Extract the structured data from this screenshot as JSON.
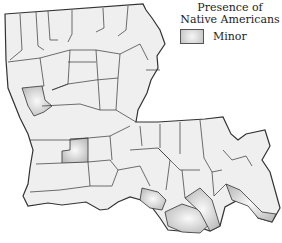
{
  "legend": {
    "title_line1": "Presence of",
    "title_line2": "Native Americans",
    "items": [
      {
        "label": "Minor",
        "color": "#c8c8c8"
      }
    ]
  },
  "map": {
    "region": "Louisiana parishes",
    "base_fill": "#efefef",
    "highlight_fill": "#c8c8c8",
    "border_color": "#333333"
  }
}
